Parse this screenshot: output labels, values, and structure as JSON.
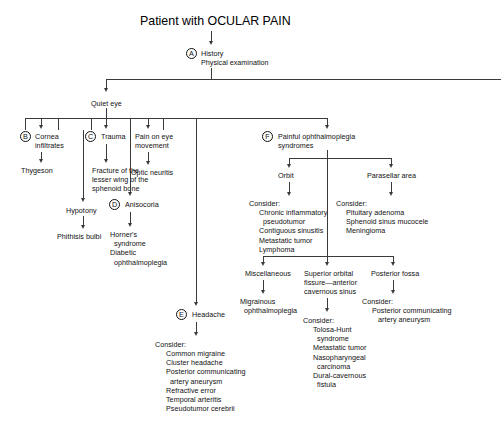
{
  "diagram": {
    "title": "Patient with OCULAR PAIN",
    "type": "clinical-decision-flowchart"
  },
  "nodes": {
    "a_marker": "A",
    "a_line1": "History",
    "a_line2": "Physical examination",
    "quiet_eye": "Quiet eye",
    "b_marker": "B",
    "b_label": "Cornea\ninfiltrates",
    "b_child1": "Thygeson",
    "b_child2": "Hypotony",
    "b_child3": "Phithisis bulbi",
    "c_marker": "C",
    "c_label": "Trauma",
    "c_child1": "Fracture of the\nlesser wing of the\nsphenoid bone",
    "d_marker": "D",
    "d_label": "Anisocoria",
    "d_child": "Horner's\n  syndrome\nDiabetic\n  ophthalmoplegia",
    "pain_on_eye_movement": "Pain on eye\nmovement",
    "optic_neuritis": "Optic neuritis",
    "e_marker": "E",
    "e_label": "Headache",
    "e_consider_header": "Consider:",
    "e_consider_items": "Common migraine\nCluster headache\nPosterior communicating\n  artery aneurysm\nRefractive error\nTemporal arteritis\nPseudotumor cerebrii",
    "f_marker": "F",
    "f_label": "Painful ophthalmoplegia\nsyndromes",
    "orbit": "Orbit",
    "orbit_consider_header": "Consider:",
    "orbit_consider_items": "Chronic inflammatory\n  pseudotumor\nContiguous sinusitis\nMetastatic tumor\nLymphoma",
    "parasellar": "Parasellar area",
    "parasellar_consider_header": "Consider:",
    "parasellar_consider_items": "Pituitary adenoma\nSphenoid sinus mucocele\nMeningioma",
    "miscellaneous": "Miscellaneous",
    "miscellaneous_child": "Migrainous\n  ophthalmoplegia",
    "sof": "Superior orbital\nfissure—anterior\ncavernous sinus",
    "sof_consider_header": "Consider:",
    "sof_consider_items": "Tolosa-Hunt\n  syndrome\nMetastatic tumor\nNasopharyngeal\n  carcinoma\nDural-cavernous\n  fistula",
    "posterior_fossa": "Posterior fossa",
    "pf_consider_header": "Consider:",
    "pf_consider_items": "Posterior communicating\n   artery aneurysm"
  },
  "style": {
    "line_color": "#3a3a3a",
    "text_color": "#111111",
    "background": "#ffffff"
  }
}
